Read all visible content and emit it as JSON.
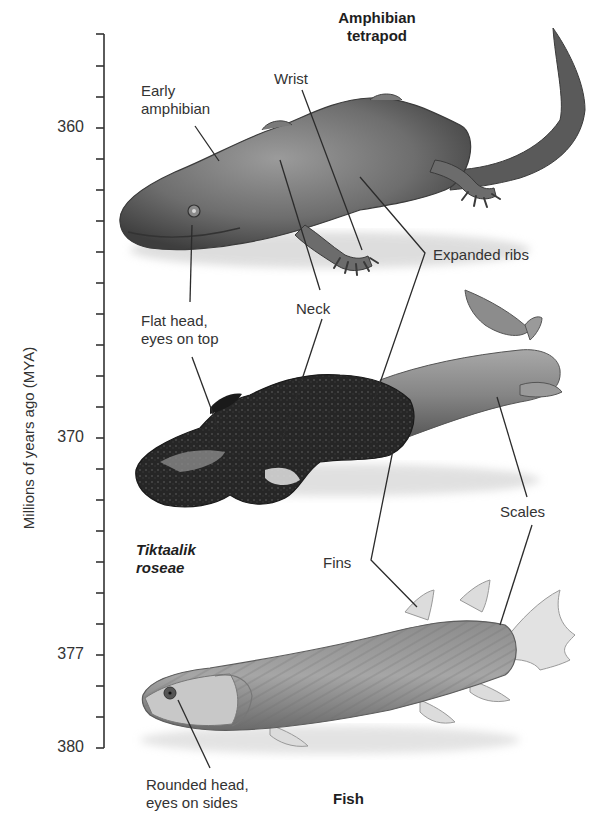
{
  "figure": {
    "type": "evolution-timeline-diagram",
    "top_title": "Amphibian\ntetrapod",
    "top_title_lines": [
      "Amphibian",
      "tetrapod"
    ],
    "bottom_title": "Fish",
    "species_label_lines": [
      "Tiktaalik",
      "roseae"
    ]
  },
  "axis": {
    "title": "Millions of years ago (MYA)",
    "orientation": "vertical",
    "direction": "increasing-downward",
    "range": [
      357,
      380
    ],
    "labeled_ticks": [
      {
        "value": 360,
        "label": "360"
      },
      {
        "value": 370,
        "label": "370"
      },
      {
        "value": 377,
        "label": "377"
      },
      {
        "value": 380,
        "label": "380"
      }
    ],
    "minor_tick_interval": 1,
    "color": "#333333"
  },
  "organisms": [
    {
      "id": "amphibian",
      "name": "Amphibian tetrapod",
      "era_mya": 360
    },
    {
      "id": "tiktaalik",
      "name": "Tiktaalik roseae",
      "era_mya": 375
    },
    {
      "id": "fish",
      "name": "Fish",
      "era_mya": 380
    }
  ],
  "labels": {
    "early_amphibian": [
      "Early",
      "amphibian"
    ],
    "wrist": "Wrist",
    "expanded_ribs": "Expanded ribs",
    "neck": "Neck",
    "flat_head": [
      "Flat head,",
      "eyes on top"
    ],
    "scales": "Scales",
    "fins": "Fins",
    "rounded_head": [
      "Rounded head,",
      "eyes on sides"
    ]
  },
  "colors": {
    "background": "#ffffff",
    "text": "#333333",
    "amphibian_body": "#6b6b6b",
    "tiktaalik_fossil": "#2a2a2a",
    "tiktaalik_flesh": "#8a8a8a",
    "fish_body": "#9a9a9a",
    "fin": "#d6d6d6",
    "leader_line": "#2b2b2b"
  }
}
